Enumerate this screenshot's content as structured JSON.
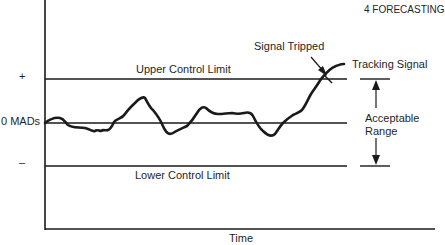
{
  "header": {
    "chapter": "4  FORECASTING"
  },
  "diagram": {
    "y_labels": {
      "plus": "+",
      "zero": "0 MADs",
      "minus": "–"
    },
    "x_label": "Time",
    "upper_limit_label": "Upper Control Limit",
    "lower_limit_label": "Lower Control Limit",
    "signal_tripped_label": "Signal Tripped",
    "tracking_signal_label": "Tracking Signal",
    "acceptable_range_label_line1": "Acceptable",
    "acceptable_range_label_line2": "Range",
    "colors": {
      "line": "#1a1a1a",
      "background": "#ffffff"
    }
  }
}
